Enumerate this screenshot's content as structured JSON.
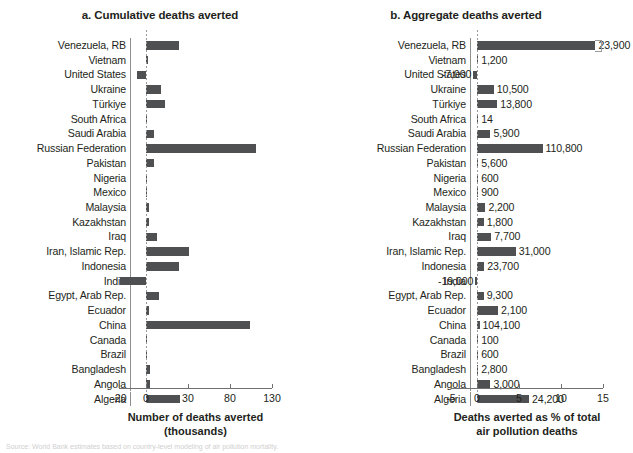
{
  "figure": {
    "footnote": "Source: World Bank estimates based on country-level modeling of air pollution mortality."
  },
  "panel_a": {
    "title": "a. Cumulative deaths averted",
    "axis_title_line1": "Number of deaths averted",
    "axis_title_line2": "(thousands)",
    "ticks": [
      "-20",
      "0",
      "30",
      "80",
      "130"
    ]
  },
  "panel_b": {
    "title": "b. Aggregate deaths averted",
    "axis_title_line1": "Deaths averted as % of total",
    "axis_title_line2": "air pollution deaths",
    "ticks": [
      "-5",
      "0",
      "5",
      "10",
      "15"
    ]
  },
  "chart_data": [
    {
      "type": "bar",
      "orientation": "horizontal",
      "panel": "a",
      "title": "a. Cumulative deaths averted",
      "xlabel": "Number of deaths averted (thousands)",
      "ylabel": "",
      "xlim": [
        -20,
        130
      ],
      "xticks": [
        -20,
        0,
        30,
        80,
        130
      ],
      "grid": false,
      "legend": "none",
      "note": "x-axis tick labels -20, 0, 30, 80, 130 are drawn at equal pixel spacing",
      "categories": [
        "Venezuela, RB",
        "Vietnam",
        "United States",
        "Ukraine",
        "Türkiye",
        "South Africa",
        "Saudi Arabia",
        "Russian Federation",
        "Pakistan",
        "Nigeria",
        "Mexico",
        "Malaysia",
        "Kazakhstan",
        "Iraq",
        "Iran, Islamic Rep.",
        "Indonesia",
        "India",
        "Egypt, Arab Rep.",
        "Ecuador",
        "China",
        "Canada",
        "Brazil",
        "Bangladesh",
        "Angola",
        "Algeria"
      ],
      "values": [
        23.9,
        1.2,
        -7.0,
        10.5,
        13.8,
        0.014,
        5.9,
        110.8,
        5.6,
        0.6,
        0.9,
        2.2,
        1.8,
        7.7,
        31.0,
        23.7,
        -19.0,
        9.3,
        2.1,
        104.1,
        0.1,
        0.6,
        2.8,
        3.0,
        24.2
      ]
    },
    {
      "type": "bar",
      "orientation": "horizontal",
      "panel": "b",
      "title": "b. Aggregate deaths averted",
      "xlabel": "Deaths averted as % of total air pollution deaths",
      "ylabel": "",
      "xlim": [
        -5,
        15
      ],
      "xticks": [
        -5,
        0,
        5,
        10,
        15
      ],
      "grid": false,
      "legend": "none",
      "categories": [
        "Venezuela, RB",
        "Vietnam",
        "United States",
        "Ukraine",
        "Türkiye",
        "South Africa",
        "Saudi Arabia",
        "Russian Federation",
        "Pakistan",
        "Nigeria",
        "Mexico",
        "Malaysia",
        "Kazakhstan",
        "Iraq",
        "Iran, Islamic Rep.",
        "Indonesia",
        "India",
        "Egypt, Arab Rep.",
        "Ecuador",
        "China",
        "Canada",
        "Brazil",
        "Bangladesh",
        "Angola",
        "Algeria"
      ],
      "values": [
        14.1,
        0.1,
        -0.45,
        2.0,
        2.4,
        0.02,
        1.6,
        7.8,
        0.15,
        0.03,
        0.1,
        1.0,
        0.8,
        1.7,
        4.6,
        0.85,
        -0.2,
        0.8,
        2.5,
        0.3,
        0.02,
        0.02,
        0.1,
        1.6,
        6.2
      ],
      "data_labels": [
        "23,900",
        "1,200",
        "-7,000",
        "10,500",
        "13,800",
        "14",
        "5,900",
        "110,800",
        "5,600",
        "600",
        "900",
        "2,200",
        "1,800",
        "7,700",
        "31,000",
        "23,700",
        "-19,000",
        "9,300",
        "2,100",
        "104,100",
        "100",
        "600",
        "2,800",
        "3,000",
        "24,200"
      ],
      "data_label_side": [
        "right",
        "right",
        "left",
        "right",
        "right",
        "right",
        "right",
        "right",
        "right",
        "right",
        "right",
        "right",
        "right",
        "right",
        "right",
        "right",
        "left",
        "right",
        "right",
        "right",
        "right",
        "right",
        "right",
        "right",
        "right"
      ]
    }
  ]
}
